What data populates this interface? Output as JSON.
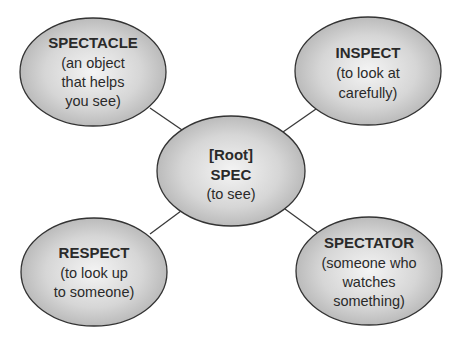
{
  "diagram": {
    "type": "word-web",
    "colors": {
      "fill_center": "#f2f2f2",
      "fill_edge": "#b5b5b5",
      "stroke": "#333333",
      "line": "#3a3a3a",
      "text": "#2a2a2a"
    },
    "center": {
      "lines": [
        "[Root]",
        "SPEC"
      ],
      "desc": [
        "(to see)"
      ]
    },
    "nodes": [
      {
        "id": "spectacle",
        "title": "SPECTACLE",
        "desc": [
          "(an object",
          "that helps",
          "you see)"
        ]
      },
      {
        "id": "inspect",
        "title": "INSPECT",
        "desc": [
          "(to look at",
          "carefully)"
        ]
      },
      {
        "id": "respect",
        "title": "RESPECT",
        "desc": [
          "(to look up",
          "to someone)"
        ]
      },
      {
        "id": "spectator",
        "title": "SPECTATOR",
        "desc": [
          "(someone who",
          "watches",
          "something)"
        ]
      }
    ]
  }
}
